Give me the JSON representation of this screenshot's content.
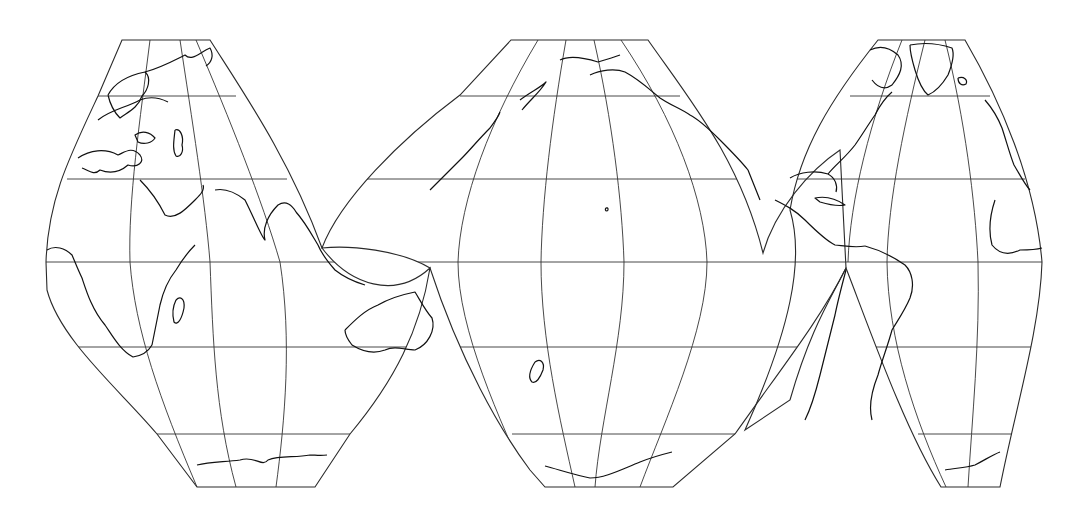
{
  "map": {
    "projection": "interrupted-world-map",
    "background": "#ffffff",
    "line_color": "#2a2a2a",
    "equator_y": 262,
    "parallels_y": [
      96,
      179,
      262,
      347,
      434
    ],
    "lobes": [
      {
        "name": "eurasia-africa",
        "outline": "M122,40 L210,40 C245,95 290,160 322,248 C350,285 395,300 430,268 C420,330 395,380 350,434 L315,487 L197,487 L157,434 C120,390 60,340 47,290 L46,262 C48,200 68,160 98,96 Z",
        "meridians": [
          "M150,40 C140,120 128,200 130,262 C135,330 160,400 197,487",
          "M180,40 C192,120 205,200 210,262 C213,340 215,410 236,487",
          "M196,40 C230,120 262,200 280,262 C292,340 285,420 276,487"
        ],
        "parallels": [
          "M98,96 L236,96",
          "M67,179 L287,179",
          "M46,262 L430,262",
          "M66,347 L414,347",
          "M157,434 L350,434"
        ]
      },
      {
        "name": "pacific",
        "outline": "M511,40 L648,40 C690,100 740,160 763,253 C775,210 810,170 840,150 L846,268 C820,320 780,370 735,434 L673,487 L545,487 L530,470 C500,430 460,360 430,268 C400,250 350,245 322,248 C340,200 400,140 460,95 Z",
        "meridians": [
          "M538,40 C490,120 460,200 458,262 C458,330 500,420 530,487",
          "M566,40 C552,120 542,200 541,262 C541,340 560,420 575,487",
          "M594,40 C612,120 622,200 624,262 C624,340 600,420 595,487",
          "M621,40 C675,120 705,200 707,262 C707,330 665,420 640,487"
        ],
        "parallels": [
          "M460,96 L680,96",
          "M358,179 L745,179",
          "M322,262 L846,262",
          "M455,347 L800,347",
          "M512,434 L735,434"
        ]
      },
      {
        "name": "americas-atlantic",
        "outline": "M878,40 L965,40 C1000,100 1035,180 1042,262 C1040,330 1015,410 1000,487 L941,487 C905,430 870,330 846,268 C830,300 810,330 790,400 L745,430 C790,330 805,260 790,210 C800,150 830,100 878,40 Z",
        "meridians": [
          "M902,40 C870,120 850,200 848,262",
          "M925,40 C905,120 888,200 887,262 C888,340 915,420 946,487",
          "M945,40 C965,120 975,200 978,262 C980,340 972,420 968,487"
        ],
        "parallels": [
          "M850,96 L990,96",
          "M790,179 L1025,179",
          "M846,262 L1042,262",
          "M865,347 L1033,347",
          "M918,434 L1012,434"
        ]
      }
    ],
    "coastlines": [
      {
        "name": "scandinavia",
        "d": "M108,95 C115,82 130,75 145,72 C152,78 148,90 142,96 C138,108 128,112 120,118 C114,112 110,104 108,95"
      },
      {
        "name": "europe-north",
        "d": "M98,120 C110,110 125,108 140,100 C150,96 160,98 168,102"
      },
      {
        "name": "siberia-coast",
        "d": "M145,72 C160,68 175,60 185,55 C192,62 200,52 210,48 C214,55 212,62 206,66"
      },
      {
        "name": "mediterranean",
        "d": "M78,158 C90,150 105,148 118,155 C125,152 132,146 140,155 C145,162 138,168 128,165 C120,172 110,174 100,170 C94,176 88,170 82,168"
      },
      {
        "name": "black-sea",
        "d": "M135,135 C142,130 150,132 155,138 C152,143 144,145 138,142 Z"
      },
      {
        "name": "caspian",
        "d": "M175,130 C180,128 184,136 182,145 C184,152 180,158 176,156 C172,150 174,140 175,130"
      },
      {
        "name": "arabia",
        "d": "M140,180 C150,190 160,205 165,215 C175,220 185,210 195,200 C200,195 205,190 203,185"
      },
      {
        "name": "india",
        "d": "M215,190 C225,188 235,192 245,200 C255,220 262,238 265,240 C262,228 268,215 278,205 C286,200 292,205 296,212"
      },
      {
        "name": "southeast-asia",
        "d": "M296,212 C305,222 312,235 318,245 C322,255 328,262 335,270 C345,278 355,282 365,285"
      },
      {
        "name": "africa-west",
        "d": "M47,250 C55,245 65,248 72,255 C75,262 78,270 82,278 C86,290 92,310 105,325 C112,335 120,350 133,357 C140,356 148,352 152,345"
      },
      {
        "name": "africa-east",
        "d": "M152,345 C155,330 158,315 160,305 C163,292 168,280 176,270 C182,260 188,252 195,245"
      },
      {
        "name": "madagascar",
        "d": "M176,300 C180,296 185,298 184,308 C182,318 178,326 174,322 C172,314 173,306 176,300"
      },
      {
        "name": "australia",
        "d": "M345,330 C355,320 365,310 378,305 C390,298 400,295 415,292 C420,300 425,310 432,318 C436,330 428,345 415,350 C405,350 395,345 385,350 C372,355 360,350 352,345 C348,340 345,335 345,330"
      },
      {
        "name": "antarctica-left",
        "d": "M197,465 C210,462 225,462 240,460 C255,455 262,468 268,460 C280,455 295,458 310,455 C315,455 320,456 327,455"
      },
      {
        "name": "japan",
        "d": "M430,190 C440,180 452,168 462,158 C470,150 478,140 490,128 C494,122 498,118 500,112"
      },
      {
        "name": "kamchatka",
        "d": "M520,100 C530,92 540,88 546,82 C540,92 530,100 522,110"
      },
      {
        "name": "alaska",
        "d": "M590,75 C600,70 615,68 625,72 C640,80 650,90 660,98 C670,105 680,108 690,115 C700,120 710,130 720,140"
      },
      {
        "name": "alaska-west",
        "d": "M560,60 C570,55 585,58 598,62 C605,60 612,58 620,55"
      },
      {
        "name": "pacific-nw",
        "d": "M720,140 C730,150 740,160 748,170 C752,180 756,190 760,200"
      },
      {
        "name": "new-zealand",
        "d": "M535,362 C540,358 545,362 543,370 C540,378 536,384 532,382 C528,378 530,370 535,362"
      },
      {
        "name": "hawaii",
        "d": "M606,208 C608,207 609,210 607,211 C605,211 605,209 606,208"
      },
      {
        "name": "antarctica-middle",
        "d": "M545,466 C560,470 575,475 590,478 C605,478 620,470 640,462 C650,458 660,455 672,452"
      },
      {
        "name": "central-america",
        "d": "M775,200 C785,205 795,210 805,220 C815,230 825,240 835,245 C845,246 855,248 865,246"
      },
      {
        "name": "gulf-of-mexico",
        "d": "M790,178 C800,172 815,170 828,174 C835,178 838,185 836,192"
      },
      {
        "name": "cuba",
        "d": "M815,198 C825,196 835,198 845,205 C840,206 830,205 820,202 Z"
      },
      {
        "name": "north-america-east",
        "d": "M828,174 C835,165 845,158 855,145 C862,135 868,125 875,115 C880,105 885,98 892,92"
      },
      {
        "name": "canada-arctic",
        "d": "M870,50 C880,45 890,48 898,55 C905,65 900,75 892,85 C885,90 878,88 872,80"
      },
      {
        "name": "greenland",
        "d": "M910,45 C925,42 940,44 952,48 C955,55 952,65 948,75 C942,85 935,92 928,95 C922,90 918,80 915,70 C912,60 910,52 910,45"
      },
      {
        "name": "iceland",
        "d": "M958,78 C964,76 968,80 966,84 C962,86 958,84 958,78"
      },
      {
        "name": "south-america",
        "d": "M865,246 C880,250 895,258 905,265 C912,272 915,285 910,298 C905,310 898,320 892,330 C888,345 882,360 878,375 C872,390 868,405 872,420"
      },
      {
        "name": "south-america-west",
        "d": "M846,270 C842,285 838,300 835,315 C830,335 825,355 820,375 C815,395 810,410 805,420"
      },
      {
        "name": "europe-west",
        "d": "M985,100 C992,108 998,118 1002,128 C1006,140 1010,155 1014,165 C1020,175 1025,185 1030,190"
      },
      {
        "name": "west-africa",
        "d": "M995,200 C990,215 988,230 992,245 C1000,255 1010,255 1020,250 C1028,250 1035,250 1042,248"
      },
      {
        "name": "antarctica-right",
        "d": "M945,470 C955,468 965,468 975,465 C985,460 992,455 1000,452"
      }
    ]
  }
}
